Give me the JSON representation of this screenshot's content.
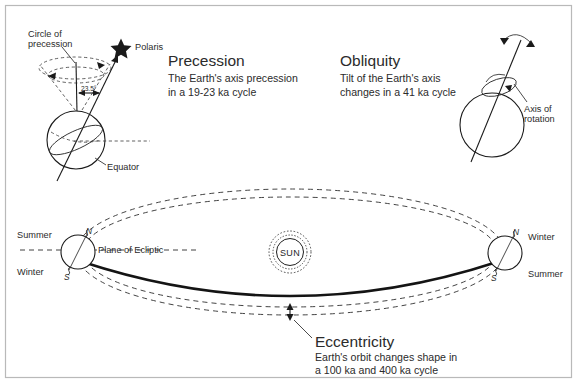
{
  "figure": {
    "background_color": "#ffffff",
    "ink_color": "#1a1a1a",
    "frame_color": "#b9b9b9"
  },
  "precession": {
    "heading": "Precession",
    "line1": "The Earth's axis precession",
    "line2": "in a 19-23 ka cycle",
    "circle_label_line1": "Circle of",
    "circle_label_line2": "precession",
    "star_label": "Polaris",
    "angle_label": "23.5°",
    "equator_label": "Equator"
  },
  "obliquity": {
    "heading": "Obliquity",
    "line1": "Tilt of the Earth's axis",
    "line2": "changes in a 41 ka cycle",
    "axis_label_line1": "Axis of",
    "axis_label_line2": "rotation"
  },
  "eccentricity": {
    "heading": "Eccentricity",
    "line1": "Earth's orbit changes shape in",
    "line2": "a 100 ka and 400 ka cycle"
  },
  "orbit": {
    "sun_label": "SUN",
    "ecliptic_label": "Plane of Ecliptic",
    "left_earth": {
      "north_pole": "N",
      "south_pole": "S",
      "upper_season": "Summer",
      "lower_season": "Winter"
    },
    "right_earth": {
      "north_pole": "N",
      "south_pole": "S",
      "upper_season": "Winter",
      "lower_season": "Summer"
    }
  }
}
